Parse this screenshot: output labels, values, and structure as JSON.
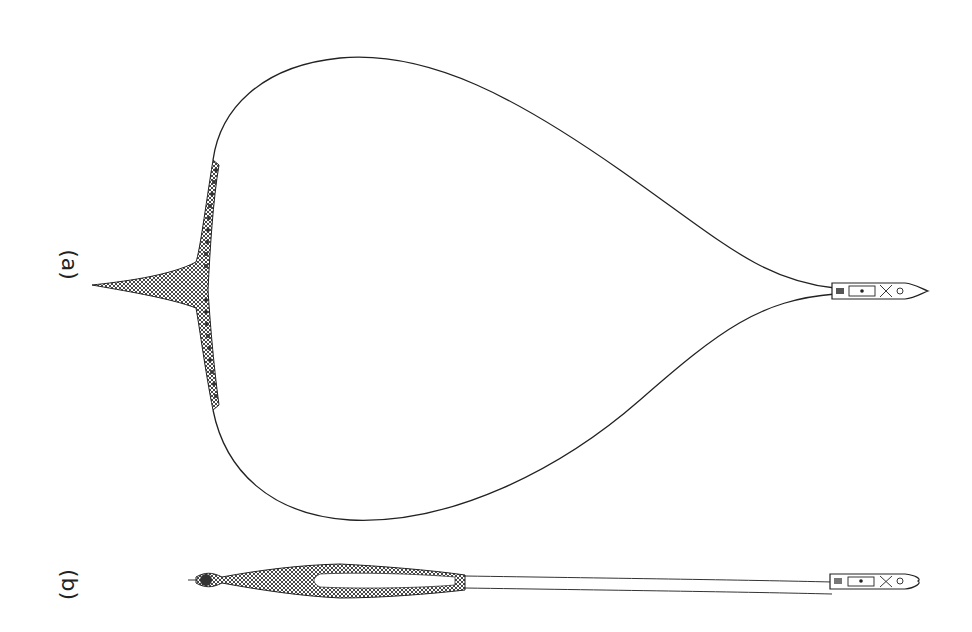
{
  "figure": {
    "panels": [
      {
        "id": "a",
        "label": "(a)",
        "description": "Purse seine net set in a circle around a school, boat at tip"
      },
      {
        "id": "b",
        "label": "(b)",
        "description": "Purse seine net pursed and hauled, boat at end"
      }
    ],
    "colors": {
      "ink": "#222222",
      "background": "#ffffff",
      "mesh": "#555555"
    }
  }
}
